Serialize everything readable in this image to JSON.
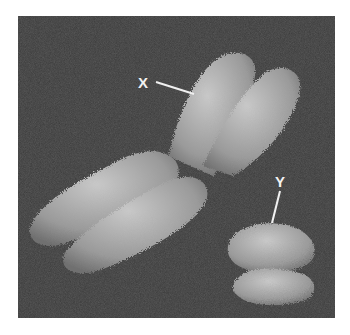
{
  "image": {
    "subject": "Scanning electron micrograph of human X and Y chromosomes",
    "labels": {
      "x_label": "X",
      "y_label": "Y"
    },
    "colors": {
      "background": "#3a3a3a",
      "chromosome": "#b5b5b5",
      "label": "#f2f2f2",
      "page": "#ffffff"
    }
  }
}
